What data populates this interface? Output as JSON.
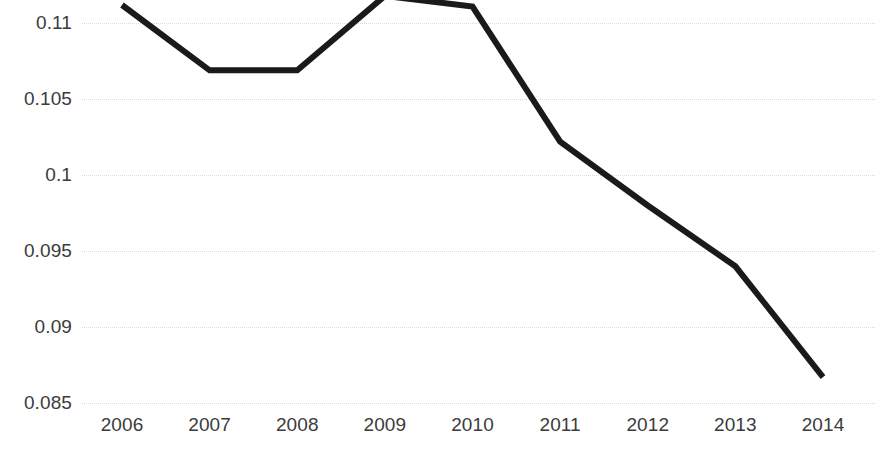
{
  "chart_data": {
    "type": "line",
    "title": "",
    "subtitle": "",
    "xlabel": "",
    "ylabel": "",
    "categories": [
      "2006",
      "2007",
      "2008",
      "2009",
      "2010",
      "2011",
      "2012",
      "2013",
      "2014"
    ],
    "x": [
      2006,
      2007,
      2008,
      2009,
      2010,
      2011,
      2012,
      2013,
      2014
    ],
    "values": [
      0.1112,
      0.1069,
      0.1069,
      0.1118,
      0.1111,
      0.1022,
      0.098,
      0.094,
      0.0867
    ],
    "series": [
      {
        "name": "",
        "values": [
          0.1112,
          0.1069,
          0.1069,
          0.1118,
          0.1111,
          0.1022,
          0.098,
          0.094,
          0.0867
        ]
      }
    ],
    "ylim": [
      0.085,
      0.11153
    ],
    "xlim": [
      2006,
      2014
    ],
    "y_ticks": [
      0.085,
      0.09,
      0.095,
      0.1,
      0.105,
      0.11
    ],
    "y_tick_labels": [
      "0.085",
      "0.09",
      "0.095",
      "0.1",
      "0.105",
      "0.11"
    ],
    "x_ticks": [
      2006,
      2007,
      2008,
      2009,
      2010,
      2011,
      2012,
      2013,
      2014
    ],
    "x_tick_labels": [
      "2006",
      "2007",
      "2008",
      "2009",
      "2010",
      "2011",
      "2012",
      "2013",
      "2014"
    ],
    "grid": true,
    "grid_axis": "y",
    "grid_style": "dotted",
    "legend": false,
    "legend_position": "none",
    "line_color": "#1a1a1a",
    "line_width": 6,
    "grid_color": "#d9d9d9",
    "tick_label_color": "#3b3b3b",
    "background_color": "#ffffff",
    "markers": false,
    "annotations": []
  },
  "axes": {
    "y_labels": [
      "0.11",
      "0.105",
      "0.1",
      "0.095",
      "0.09",
      "0.085"
    ],
    "x_labels": [
      "2006",
      "2007",
      "2008",
      "2009",
      "2010",
      "2011",
      "2012",
      "2013",
      "2014"
    ]
  }
}
